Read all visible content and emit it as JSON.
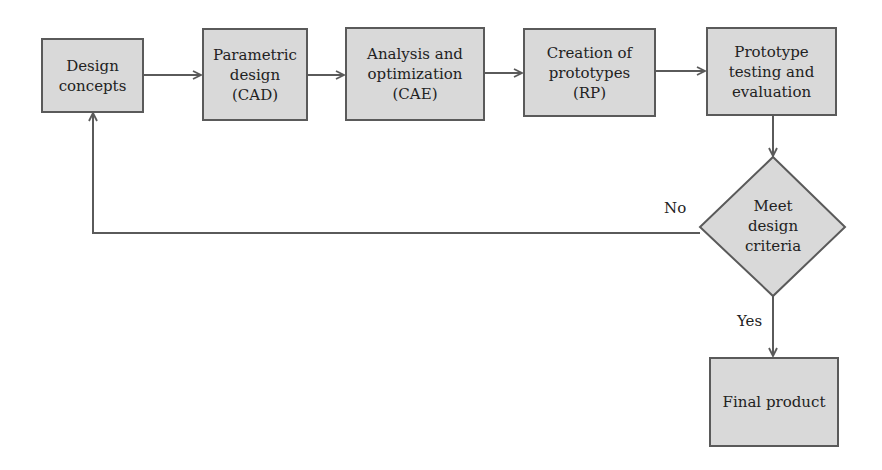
{
  "diagram": {
    "nodes": [
      {
        "id": "design-concepts",
        "label": "Design\nconcepts"
      },
      {
        "id": "parametric-design",
        "label": "Parametric\ndesign\n(CAD)"
      },
      {
        "id": "analysis-optimization",
        "label": "Analysis and\noptimization\n(CAE)"
      },
      {
        "id": "creation-prototypes",
        "label": "Creation of\nprototypes\n(RP)"
      },
      {
        "id": "prototype-testing",
        "label": "Prototype\ntesting and\nevaluation"
      },
      {
        "id": "decision",
        "label": "Meet\ndesign\ncriteria"
      },
      {
        "id": "final-product",
        "label": "Final product"
      }
    ],
    "edge_labels": {
      "no": "No",
      "yes": "Yes"
    },
    "colors": {
      "node_fill": "#d9d9d9",
      "node_border": "#5a5a5a",
      "edge": "#5a5a5a"
    }
  }
}
